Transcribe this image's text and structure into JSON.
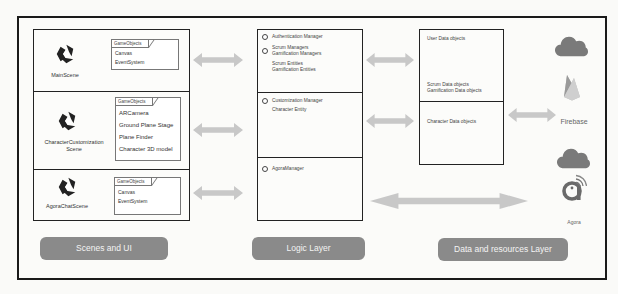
{
  "diagram": {
    "colors": {
      "border": "#1a1a1a",
      "arrow": "#c8c8c8",
      "layer_button": "#8a8a8a",
      "icon": "#7a7a7a"
    },
    "scenes_column": {
      "scenes": [
        {
          "name": "MainScene",
          "icon": "unity-logo-icon",
          "gameobjects_label": "GameObjects",
          "gameobjects": [
            "Canvas",
            "EventSystem"
          ]
        },
        {
          "name": "CharacterCustomization Scene",
          "name_line1": "CharacterCustomization",
          "name_line2": "Scene",
          "icon": "unity-logo-icon",
          "gameobjects_label": "GameObjects",
          "gameobjects": [
            "ARCamera",
            "Ground Plane Stage",
            "Plane Finder",
            "Character 3D model"
          ]
        },
        {
          "name": "AgoraChatScene",
          "icon": "unity-logo-icon",
          "gameobjects_label": "GameObjects",
          "gameobjects": [
            "Canvas",
            "EventSystem"
          ]
        }
      ],
      "layer_label": "Scenes and UI"
    },
    "logic_column": {
      "sections": [
        {
          "managers": [
            "Authentication Manager",
            "Scrum Managers",
            "Gamification Managers"
          ],
          "entities": [
            "Scrum Entities",
            "Gamification Entities"
          ]
        },
        {
          "managers": [
            "Customization Manager"
          ],
          "entities": [
            "Character Entity"
          ]
        },
        {
          "managers": [
            "AgoraManager"
          ],
          "entities": []
        }
      ],
      "layer_label": "Logic Layer"
    },
    "data_column": {
      "sections": [
        {
          "items": [
            "User Data objects",
            "Scrum Data objects",
            "Gamification Data objects"
          ]
        },
        {
          "items": [
            "Character Data objects"
          ]
        }
      ],
      "layer_label": "Data and resources Layer"
    },
    "services": [
      {
        "name": "Firebase",
        "icons": [
          "cloud-icon",
          "firebase-logo-icon"
        ]
      },
      {
        "name": "Agora",
        "icons": [
          "cloud-icon",
          "agora-logo-icon"
        ]
      }
    ]
  }
}
